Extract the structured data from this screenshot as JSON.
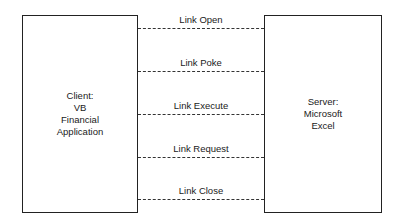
{
  "client": {
    "lines": [
      "Client:",
      "VB",
      "Financial",
      "Application"
    ]
  },
  "server": {
    "lines": [
      "Server:",
      "Microsoft",
      "Excel"
    ]
  },
  "messages": [
    {
      "label": "Link Open",
      "y": 28
    },
    {
      "label": "Link Poke",
      "y": 71
    },
    {
      "label": "Link Execute",
      "y": 114
    },
    {
      "label": "Link Request",
      "y": 157
    },
    {
      "label": "Link Close",
      "y": 199
    }
  ]
}
